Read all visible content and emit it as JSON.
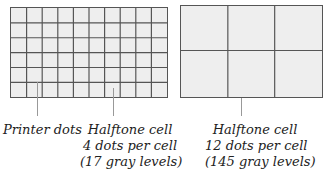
{
  "figure": {
    "title_fragment": "Figure  Printer dots and halftone cells",
    "left_grid": {
      "columns": 10,
      "rows": 6,
      "description": "fine grid of printer dots"
    },
    "right_grid": {
      "columns": 3,
      "rows": 2,
      "description": "coarse grid of halftone cells"
    },
    "labels": {
      "printer_dots": "Printer dots",
      "cell_small": {
        "line1": "Halftone cell",
        "line2": "4 dots per cell",
        "line3": "(17 gray levels)"
      },
      "cell_large": {
        "line1": "Halftone cell",
        "line2": "12 dots per cell",
        "line3": "(145 gray levels)"
      }
    },
    "colors": {
      "grid_line": "#555555",
      "fill": "#eeeeee",
      "leader": "#999999"
    }
  }
}
